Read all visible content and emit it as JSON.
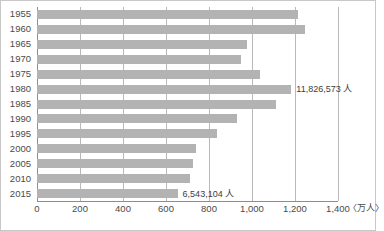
{
  "chart_data": {
    "type": "bar",
    "orientation": "horizontal",
    "title": "",
    "subtitle": "",
    "xlabel": "(万人)",
    "ylabel": "",
    "xlim": [
      0,
      1400
    ],
    "ylim": null,
    "grid": true,
    "legend": false,
    "legend_position": "none",
    "unit_label": "〈万人〉",
    "categories": [
      "1955",
      "1960",
      "1965",
      "1970",
      "1975",
      "1980",
      "1985",
      "1990",
      "1995",
      "2000",
      "2005",
      "2010",
      "2015"
    ],
    "values": [
      1215,
      1245,
      975,
      950,
      1035,
      1183,
      1110,
      930,
      838,
      740,
      725,
      712,
      654
    ],
    "xticks": [
      0,
      200,
      400,
      600,
      800,
      1000,
      1200,
      1400
    ],
    "xtick_labels": [
      "0",
      "200",
      "400",
      "600",
      "800",
      "1,000",
      "1,200",
      "1,400"
    ],
    "annotations": [
      {
        "category": "1980",
        "text": "11,826,573 人",
        "value": 1183
      },
      {
        "category": "2015",
        "text": "6,543,104 人",
        "value": 654
      }
    ],
    "colors": {
      "bar": "#b3b3b3",
      "gridline": "#b9b9b9",
      "axis": "#8d8d8d",
      "text": "#4a4a4a",
      "background": "#ffffff",
      "border": "#c8c8c8"
    }
  }
}
